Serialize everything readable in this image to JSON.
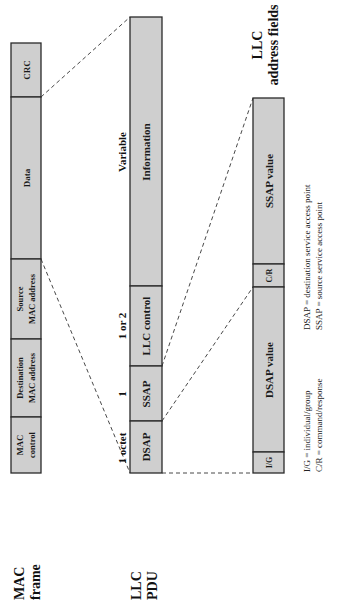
{
  "diagram": {
    "orientation": "rotated-90-ccw",
    "colors": {
      "field_fill": "#cfcfcf",
      "border": "#2a2a2a",
      "text": "#1a1a1a",
      "background": "#ffffff"
    },
    "mac_frame": {
      "label_line1": "MAC",
      "label_line2": "frame",
      "fields": [
        {
          "id": "mac-control",
          "line1": "MAC",
          "line2": "control"
        },
        {
          "id": "destination-mac-address",
          "line1": "Destination",
          "line2": "MAC address"
        },
        {
          "id": "source-mac-address",
          "line1": "Source",
          "line2": "MAC address"
        },
        {
          "id": "data",
          "line1": "Data",
          "line2": ""
        },
        {
          "id": "crc",
          "line1": "CRC",
          "line2": ""
        }
      ]
    },
    "llc_pdu": {
      "label_line1": "LLC",
      "label_line2": "PDU",
      "sizes": [
        "1 octet",
        "1",
        "1 or 2",
        "Variable"
      ],
      "fields": [
        {
          "id": "dsap",
          "label": "DSAP"
        },
        {
          "id": "ssap",
          "label": "SSAP"
        },
        {
          "id": "llc-control",
          "label": "LLC control"
        },
        {
          "id": "information",
          "label": "Information"
        }
      ]
    },
    "llc_address_fields": {
      "label_line1": "LLC",
      "label_line2": "address fields",
      "fields": [
        {
          "id": "ig",
          "label": "I/G"
        },
        {
          "id": "dsap-value",
          "label": "DSAP value"
        },
        {
          "id": "cr",
          "label": "C/R"
        },
        {
          "id": "ssap-value",
          "label": "SSAP value"
        }
      ]
    },
    "legend": [
      "I/G = individual/group",
      "C/R = command/response",
      "DSAP = destination service access point",
      "SSAP = source service access point"
    ]
  }
}
